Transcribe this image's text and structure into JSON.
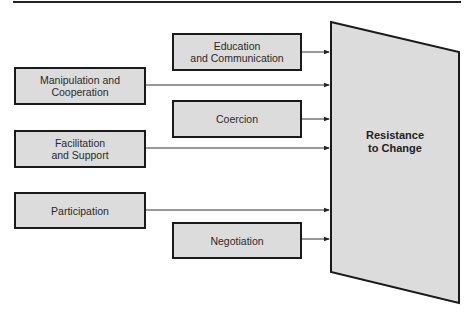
{
  "diagram": {
    "target": {
      "line1": "Resistance",
      "line2": "to Change"
    },
    "boxes": [
      {
        "id": "education",
        "line1": "Education",
        "line2": "and Communication"
      },
      {
        "id": "manipulation",
        "line1": "Manipulation and",
        "line2": "Cooperation"
      },
      {
        "id": "coercion",
        "line1": "Coercion",
        "line2": ""
      },
      {
        "id": "facilitation",
        "line1": "Facilitation",
        "line2": "and Support"
      },
      {
        "id": "participation",
        "line1": "Participation",
        "line2": ""
      },
      {
        "id": "negotiation",
        "line1": "Negotiation",
        "line2": ""
      }
    ],
    "colors": {
      "box_fill": "#dcdcdc",
      "outline": "#1a1a1a",
      "target_fill": "#dcdcdc"
    }
  }
}
